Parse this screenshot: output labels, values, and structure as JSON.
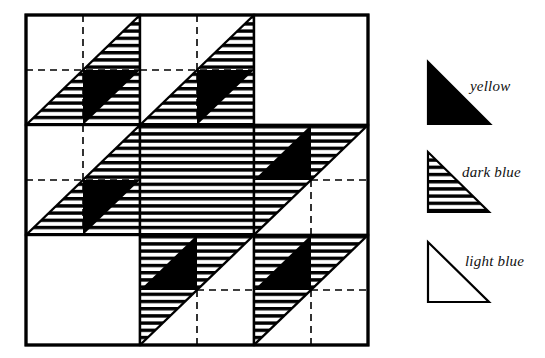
{
  "figure": {
    "type": "quilt-block-diagram"
  },
  "quilt": {
    "grid": {
      "rows": 3,
      "cols": 3
    },
    "bounds": {
      "x": 26,
      "y": 15,
      "width": 343,
      "height": 330
    },
    "fabrics": {
      "yellow": "#000000",
      "dark_blue": "striped",
      "light_blue": "#ffffff"
    },
    "blocks": [
      {
        "row": 0,
        "col": 0,
        "name": "block-top-left",
        "kind": "A"
      },
      {
        "row": 0,
        "col": 1,
        "name": "block-top-center",
        "kind": "A"
      },
      {
        "row": 0,
        "col": 2,
        "name": "block-top-right",
        "kind": "plain"
      },
      {
        "row": 1,
        "col": 0,
        "name": "block-middle-left",
        "kind": "A"
      },
      {
        "row": 1,
        "col": 1,
        "name": "block-center",
        "kind": "full"
      },
      {
        "row": 1,
        "col": 2,
        "name": "block-middle-right",
        "kind": "B"
      },
      {
        "row": 2,
        "col": 0,
        "name": "block-bottom-left",
        "kind": "plain"
      },
      {
        "row": 2,
        "col": 1,
        "name": "block-bottom-center",
        "kind": "B"
      },
      {
        "row": 2,
        "col": 2,
        "name": "block-bottom-right",
        "kind": "B"
      }
    ]
  },
  "legend": {
    "items": [
      {
        "key": "yellow",
        "label": "yellow",
        "swatch": "solid-black-triangle"
      },
      {
        "key": "dark_blue",
        "label": "dark blue",
        "swatch": "striped-triangle"
      },
      {
        "key": "light_blue",
        "label": "light blue",
        "swatch": "outline-triangle"
      }
    ]
  }
}
